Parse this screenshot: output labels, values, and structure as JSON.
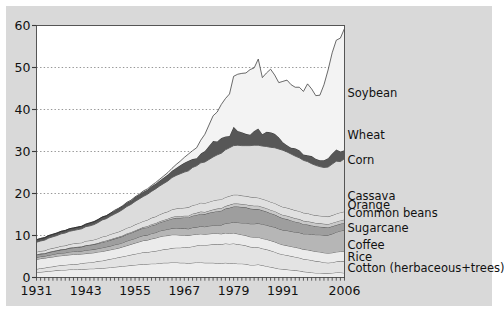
{
  "chart_data": {
    "type": "area",
    "stacked": true,
    "title": "",
    "xlabel": "",
    "ylabel": "",
    "xlim": [
      1931,
      2006
    ],
    "ylim": [
      0,
      60
    ],
    "yticks": [
      0,
      10,
      20,
      30,
      40,
      50,
      60
    ],
    "xticks": [
      1931,
      1943,
      1955,
      1967,
      1979,
      1991,
      2006
    ],
    "grid": "horizontal-dotted",
    "legend_position": "right-inline-labels",
    "tick_interval_minor": 1,
    "x": [
      1931,
      1932,
      1933,
      1934,
      1935,
      1936,
      1937,
      1938,
      1939,
      1940,
      1941,
      1942,
      1943,
      1944,
      1945,
      1946,
      1947,
      1948,
      1949,
      1950,
      1951,
      1952,
      1953,
      1954,
      1955,
      1956,
      1957,
      1958,
      1959,
      1960,
      1961,
      1962,
      1963,
      1964,
      1965,
      1966,
      1967,
      1968,
      1969,
      1970,
      1971,
      1972,
      1973,
      1974,
      1975,
      1976,
      1977,
      1978,
      1979,
      1980,
      1981,
      1982,
      1983,
      1984,
      1985,
      1986,
      1987,
      1988,
      1989,
      1990,
      1991,
      1992,
      1993,
      1994,
      1995,
      1996,
      1997,
      1998,
      1999,
      2000,
      2001,
      2002,
      2003,
      2004,
      2005,
      2006
    ],
    "series": [
      {
        "name": "Cotton (herbaceous+trees)",
        "color": "#ededed",
        "values": [
          1.2,
          1.3,
          1.4,
          1.5,
          1.6,
          1.7,
          1.8,
          1.8,
          1.9,
          1.9,
          1.9,
          2.0,
          2.0,
          2.1,
          2.1,
          2.2,
          2.2,
          2.3,
          2.4,
          2.5,
          2.6,
          2.7,
          2.8,
          2.9,
          3.0,
          3.1,
          3.2,
          3.2,
          3.3,
          3.3,
          3.4,
          3.5,
          3.5,
          3.6,
          3.6,
          3.5,
          3.5,
          3.4,
          3.5,
          3.6,
          3.6,
          3.5,
          3.5,
          3.5,
          3.4,
          3.4,
          3.5,
          3.4,
          3.4,
          3.3,
          3.3,
          3.2,
          3.0,
          3.0,
          3.1,
          2.9,
          2.7,
          2.5,
          2.3,
          2.1,
          2.0,
          1.9,
          1.8,
          1.7,
          1.6,
          1.4,
          1.3,
          1.2,
          1.1,
          1.1,
          1.0,
          1.0,
          1.1,
          1.2,
          1.2,
          1.1
        ]
      },
      {
        "name": "Rice",
        "color": "#e3e3e3",
        "values": [
          0.8,
          0.9,
          0.9,
          1.0,
          1.0,
          1.1,
          1.1,
          1.2,
          1.2,
          1.3,
          1.3,
          1.4,
          1.5,
          1.5,
          1.6,
          1.7,
          1.8,
          1.9,
          2.0,
          2.1,
          2.2,
          2.3,
          2.4,
          2.5,
          2.6,
          2.7,
          2.8,
          2.8,
          2.9,
          3.0,
          3.1,
          3.2,
          3.3,
          3.4,
          3.5,
          3.6,
          3.7,
          3.8,
          3.9,
          4.0,
          4.1,
          4.2,
          4.3,
          4.4,
          4.5,
          4.5,
          4.6,
          4.6,
          4.7,
          4.6,
          4.5,
          4.4,
          4.3,
          4.2,
          4.1,
          4.0,
          4.0,
          3.9,
          3.8,
          3.6,
          3.5,
          3.4,
          3.3,
          3.2,
          3.1,
          3.0,
          3.0,
          2.9,
          2.8,
          2.7,
          2.6,
          2.5,
          2.5,
          2.6,
          2.7,
          2.8
        ]
      },
      {
        "name": "Coffee",
        "color": "#ebebeb",
        "values": [
          2.3,
          2.3,
          2.3,
          2.3,
          2.3,
          2.3,
          2.3,
          2.3,
          2.3,
          2.3,
          2.3,
          2.2,
          2.2,
          2.2,
          2.2,
          2.2,
          2.2,
          2.2,
          2.2,
          2.2,
          2.2,
          2.3,
          2.4,
          2.5,
          2.6,
          2.7,
          2.8,
          2.9,
          3.0,
          3.1,
          3.2,
          3.2,
          3.2,
          3.2,
          3.1,
          3.0,
          2.9,
          2.8,
          2.8,
          2.7,
          2.7,
          2.6,
          2.6,
          2.6,
          2.6,
          2.5,
          2.5,
          2.5,
          2.5,
          2.5,
          2.4,
          2.4,
          2.4,
          2.4,
          2.4,
          2.4,
          2.4,
          2.4,
          2.4,
          2.4,
          2.3,
          2.3,
          2.3,
          2.3,
          2.3,
          2.3,
          2.3,
          2.3,
          2.3,
          2.3,
          2.3,
          2.3,
          2.3,
          2.3,
          2.3,
          2.3
        ]
      },
      {
        "name": "Sugarcane",
        "color": "#b6b6b6",
        "values": [
          0.5,
          0.5,
          0.5,
          0.5,
          0.6,
          0.6,
          0.6,
          0.6,
          0.7,
          0.7,
          0.7,
          0.7,
          0.8,
          0.8,
          0.8,
          0.8,
          0.9,
          0.9,
          0.9,
          1.0,
          1.0,
          1.0,
          1.1,
          1.1,
          1.1,
          1.2,
          1.2,
          1.2,
          1.3,
          1.3,
          1.4,
          1.4,
          1.5,
          1.5,
          1.6,
          1.6,
          1.6,
          1.6,
          1.7,
          1.7,
          1.8,
          1.8,
          1.9,
          1.9,
          2.0,
          2.1,
          2.3,
          2.5,
          2.6,
          2.7,
          2.8,
          3.0,
          3.1,
          3.2,
          3.3,
          3.4,
          3.4,
          3.4,
          3.5,
          3.5,
          3.5,
          3.6,
          3.6,
          3.6,
          3.7,
          3.7,
          3.8,
          3.9,
          4.0,
          4.1,
          4.2,
          4.3,
          4.5,
          4.7,
          4.9,
          5.1
        ]
      },
      {
        "name": "Common beans",
        "color": "#9e9e9e",
        "values": [
          0.6,
          0.6,
          0.6,
          0.7,
          0.7,
          0.7,
          0.8,
          0.8,
          0.9,
          0.9,
          1.0,
          1.0,
          1.1,
          1.1,
          1.2,
          1.2,
          1.3,
          1.3,
          1.4,
          1.4,
          1.5,
          1.5,
          1.6,
          1.6,
          1.7,
          1.7,
          1.8,
          1.8,
          1.9,
          1.9,
          2.0,
          2.1,
          2.2,
          2.3,
          2.4,
          2.5,
          2.6,
          2.7,
          2.8,
          2.9,
          3.0,
          3.0,
          3.1,
          3.2,
          3.3,
          3.4,
          3.5,
          3.6,
          3.7,
          3.8,
          3.8,
          3.7,
          3.6,
          3.5,
          3.4,
          3.3,
          3.2,
          3.1,
          3.0,
          2.9,
          2.8,
          2.7,
          2.6,
          2.5,
          2.4,
          2.3,
          2.2,
          2.1,
          2.0,
          1.9,
          1.9,
          1.8,
          1.8,
          1.7,
          1.7,
          1.7
        ]
      },
      {
        "name": "Orange",
        "color": "#c9c9c9",
        "values": [
          0.1,
          0.1,
          0.1,
          0.1,
          0.1,
          0.1,
          0.1,
          0.1,
          0.1,
          0.1,
          0.1,
          0.1,
          0.1,
          0.1,
          0.1,
          0.1,
          0.2,
          0.2,
          0.2,
          0.2,
          0.2,
          0.2,
          0.2,
          0.2,
          0.2,
          0.2,
          0.2,
          0.3,
          0.3,
          0.3,
          0.3,
          0.3,
          0.3,
          0.4,
          0.4,
          0.4,
          0.4,
          0.4,
          0.5,
          0.5,
          0.5,
          0.5,
          0.5,
          0.6,
          0.6,
          0.6,
          0.6,
          0.7,
          0.7,
          0.7,
          0.7,
          0.7,
          0.8,
          0.8,
          0.8,
          0.8,
          0.8,
          0.8,
          0.8,
          0.8,
          0.8,
          0.8,
          0.8,
          0.8,
          0.8,
          0.8,
          0.8,
          0.8,
          0.8,
          0.8,
          0.8,
          0.8,
          0.8,
          0.8,
          0.8,
          0.8
        ]
      },
      {
        "name": "Cassava",
        "color": "#e0e0e0",
        "values": [
          0.6,
          0.6,
          0.6,
          0.7,
          0.7,
          0.7,
          0.8,
          0.8,
          0.8,
          0.9,
          0.9,
          0.9,
          1.0,
          1.0,
          1.0,
          1.1,
          1.1,
          1.1,
          1.2,
          1.2,
          1.2,
          1.3,
          1.3,
          1.3,
          1.4,
          1.4,
          1.4,
          1.5,
          1.5,
          1.6,
          1.6,
          1.7,
          1.7,
          1.8,
          1.8,
          1.9,
          1.9,
          2.0,
          2.0,
          2.0,
          2.1,
          2.1,
          2.1,
          2.1,
          2.1,
          2.1,
          2.1,
          2.1,
          2.1,
          2.1,
          2.0,
          2.0,
          2.0,
          2.0,
          1.9,
          1.9,
          1.9,
          1.9,
          1.9,
          1.9,
          1.9,
          1.9,
          1.9,
          1.9,
          1.9,
          1.9,
          1.9,
          1.8,
          1.8,
          1.8,
          1.8,
          1.8,
          1.8,
          1.9,
          1.9,
          1.9
        ]
      },
      {
        "name": "Corn",
        "color": "#dcdcdc",
        "values": [
          2.3,
          2.4,
          2.5,
          2.6,
          2.7,
          2.8,
          2.9,
          3.0,
          3.1,
          3.1,
          3.2,
          3.3,
          3.4,
          3.5,
          3.6,
          3.8,
          4.0,
          4.1,
          4.3,
          4.5,
          4.7,
          4.9,
          5.1,
          5.3,
          5.5,
          5.7,
          5.9,
          6.1,
          6.3,
          6.6,
          6.8,
          7.0,
          7.3,
          7.6,
          7.9,
          8.2,
          8.5,
          8.7,
          9.0,
          9.2,
          9.5,
          9.8,
          10.1,
          10.4,
          10.7,
          11.0,
          11.3,
          11.5,
          11.7,
          11.8,
          11.9,
          12.0,
          12.2,
          12.4,
          12.5,
          12.6,
          12.8,
          13.0,
          13.2,
          13.4,
          13.5,
          13.3,
          13.1,
          12.9,
          12.7,
          12.5,
          12.3,
          12.1,
          11.9,
          11.7,
          11.6,
          11.8,
          12.2,
          12.5,
          12.1,
          12.6
        ]
      },
      {
        "name": "Wheat",
        "color": "#575757",
        "values": [
          0.6,
          0.6,
          0.6,
          0.6,
          0.6,
          0.6,
          0.6,
          0.6,
          0.6,
          0.6,
          0.6,
          0.6,
          0.6,
          0.7,
          0.7,
          0.7,
          0.7,
          0.7,
          0.7,
          0.8,
          0.8,
          0.8,
          0.9,
          0.9,
          1.0,
          1.0,
          1.1,
          1.1,
          1.2,
          1.2,
          1.3,
          1.4,
          1.5,
          1.6,
          1.8,
          2.0,
          2.2,
          2.4,
          2.0,
          1.8,
          2.2,
          2.6,
          3.2,
          3.8,
          3.2,
          3.6,
          3.2,
          2.8,
          4.5,
          3.4,
          3.2,
          2.8,
          2.6,
          3.4,
          4.0,
          2.8,
          3.5,
          3.6,
          3.3,
          2.8,
          1.9,
          1.6,
          1.5,
          1.9,
          1.8,
          1.4,
          1.5,
          1.8,
          1.6,
          1.5,
          1.7,
          2.1,
          2.5,
          2.8,
          2.4,
          2.0
        ]
      },
      {
        "name": "Soybean",
        "color": "#f3f3f3",
        "values": [
          0.0,
          0.0,
          0.0,
          0.0,
          0.0,
          0.0,
          0.0,
          0.0,
          0.0,
          0.0,
          0.0,
          0.0,
          0.0,
          0.0,
          0.0,
          0.0,
          0.0,
          0.0,
          0.0,
          0.1,
          0.1,
          0.1,
          0.1,
          0.1,
          0.1,
          0.1,
          0.2,
          0.2,
          0.2,
          0.3,
          0.3,
          0.4,
          0.5,
          0.6,
          0.8,
          1.0,
          1.3,
          1.6,
          2.0,
          2.5,
          3.2,
          4.0,
          5.0,
          6.0,
          7.0,
          8.0,
          9.0,
          10.0,
          12.0,
          13.5,
          14.0,
          14.5,
          15.5,
          15.0,
          16.5,
          13.5,
          14.0,
          15.0,
          14.0,
          13.0,
          14.5,
          15.5,
          15.0,
          14.5,
          15.0,
          15.0,
          17.0,
          16.0,
          15.0,
          15.5,
          18.0,
          21.0,
          24.0,
          26.0,
          27.0,
          29.0
        ]
      }
    ],
    "label_anchors": [
      {
        "name": "Soybean",
        "y_value": 44.0
      },
      {
        "name": "Wheat",
        "y_value": 34.0
      },
      {
        "name": "Corn",
        "y_value": 28.0
      },
      {
        "name": "Cassava",
        "y_value": 19.5
      },
      {
        "name": "Orange",
        "y_value": 17.3
      },
      {
        "name": "Common beans",
        "y_value": 15.4
      },
      {
        "name": "Sugarcane",
        "y_value": 11.8
      },
      {
        "name": "Coffee",
        "y_value": 7.7
      },
      {
        "name": "Rice",
        "y_value": 5.0
      },
      {
        "name": "Cotton (herbaceous+trees)",
        "y_value": 2.2
      }
    ]
  },
  "figure": {
    "background": "#d9d9d9",
    "plot_background": "#ffffff",
    "axis_color": "#555555",
    "grid_color": "#8a8a8a",
    "text_color": "#111111"
  }
}
